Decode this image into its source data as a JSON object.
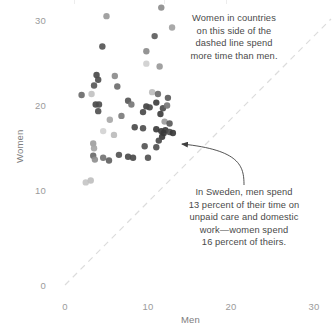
{
  "chart_data": {
    "type": "scatter",
    "title": "",
    "xlabel": "Men",
    "ylabel": "Women",
    "xlim": [
      -0.8,
      32
    ],
    "ylim": [
      -2.2,
      33
    ],
    "xticks": [
      0,
      10,
      20,
      30
    ],
    "yticks": [
      0,
      10,
      20,
      30
    ],
    "xtick_labels": [
      "0",
      "10",
      "20",
      "30"
    ],
    "ytick_labels": [
      "0",
      "10",
      "20",
      "30"
    ],
    "grid": false,
    "legend": "none",
    "reference_line": {
      "name": "parity-line",
      "type": "dashed-diagonal",
      "from": [
        0,
        0
      ],
      "to": [
        32,
        32
      ],
      "color": "#dcdcdc",
      "description": "y = x parity line"
    },
    "marker": {
      "shape": "circle",
      "radius_px": 3.2,
      "opacity": 0.92
    },
    "points": [
      {
        "x": 5.0,
        "y": 28.3,
        "c": "#9a9a9a"
      },
      {
        "x": 11.6,
        "y": 29.2,
        "c": "#8d8d8d"
      },
      {
        "x": 12.9,
        "y": 27.1,
        "c": "#a2a2a2"
      },
      {
        "x": 10.8,
        "y": 26.2,
        "c": "#5d5d5d"
      },
      {
        "x": 4.5,
        "y": 25.1,
        "c": "#555555"
      },
      {
        "x": 9.8,
        "y": 24.6,
        "c": "#8b8b8b"
      },
      {
        "x": 9.8,
        "y": 23.3,
        "c": "#cfcfcf"
      },
      {
        "x": 11.4,
        "y": 23.0,
        "c": "#999999"
      },
      {
        "x": 3.8,
        "y": 22.1,
        "c": "#4b4b4b"
      },
      {
        "x": 4.0,
        "y": 21.6,
        "c": "#4f4f4f"
      },
      {
        "x": 6.0,
        "y": 22.0,
        "c": "#8c8c8c"
      },
      {
        "x": 3.5,
        "y": 21.0,
        "c": "#5a5a5a"
      },
      {
        "x": 6.3,
        "y": 20.9,
        "c": "#6e6e6e"
      },
      {
        "x": 2.0,
        "y": 20.0,
        "c": "#6b6b6b"
      },
      {
        "x": 3.2,
        "y": 20.1,
        "c": "#c2c2c2"
      },
      {
        "x": 10.5,
        "y": 20.3,
        "c": "#bdbdbd"
      },
      {
        "x": 11.2,
        "y": 20.1,
        "c": "#6d6d6d"
      },
      {
        "x": 12.4,
        "y": 19.7,
        "c": "#5b5b5b"
      },
      {
        "x": 3.7,
        "y": 19.0,
        "c": "#4a4a4a"
      },
      {
        "x": 4.1,
        "y": 19.0,
        "c": "#4d4d4d"
      },
      {
        "x": 7.6,
        "y": 19.4,
        "c": "#575757"
      },
      {
        "x": 8.0,
        "y": 19.0,
        "c": "#777777"
      },
      {
        "x": 9.8,
        "y": 18.8,
        "c": "#434343"
      },
      {
        "x": 10.2,
        "y": 18.7,
        "c": "#4a4a4a"
      },
      {
        "x": 11.0,
        "y": 19.2,
        "c": "#3f3f3f"
      },
      {
        "x": 11.8,
        "y": 18.6,
        "c": "#4d4d4d"
      },
      {
        "x": 12.3,
        "y": 18.9,
        "c": "#777777"
      },
      {
        "x": 4.0,
        "y": 18.3,
        "c": "#515151"
      },
      {
        "x": 6.8,
        "y": 17.8,
        "c": "#7c7c7c"
      },
      {
        "x": 9.4,
        "y": 18.2,
        "c": "#4a4a4a"
      },
      {
        "x": 11.5,
        "y": 18.0,
        "c": "#3d3d3d"
      },
      {
        "x": 5.4,
        "y": 17.4,
        "c": "#a8a8a8"
      },
      {
        "x": 12.0,
        "y": 17.2,
        "c": "#9c9c9c"
      },
      {
        "x": 12.6,
        "y": 17.0,
        "c": "#5a5a5a"
      },
      {
        "x": 4.6,
        "y": 16.2,
        "c": "#d3d3d3"
      },
      {
        "x": 8.4,
        "y": 16.6,
        "c": "#4b4b4b"
      },
      {
        "x": 9.4,
        "y": 16.5,
        "c": "#4f4f4f"
      },
      {
        "x": 11.0,
        "y": 16.4,
        "c": "#3c3c3c"
      },
      {
        "x": 11.6,
        "y": 16.2,
        "c": "#3a3a3a"
      },
      {
        "x": 11.9,
        "y": 16.0,
        "c": "#3a3a3a"
      },
      {
        "x": 12.1,
        "y": 16.3,
        "c": "#3a3a3a"
      },
      {
        "x": 11.7,
        "y": 15.6,
        "c": "#3a3a3a"
      },
      {
        "x": 12.6,
        "y": 16.1,
        "c": "#4f4f4f"
      },
      {
        "x": 5.9,
        "y": 15.8,
        "c": "#bcbcbc"
      },
      {
        "x": 11.3,
        "y": 15.2,
        "c": "#4a4a4a"
      },
      {
        "x": 13.0,
        "y": 16.0,
        "c": "#3a3a3a",
        "label": "Sweden"
      },
      {
        "x": 3.4,
        "y": 14.9,
        "c": "#9e9e9e"
      },
      {
        "x": 3.5,
        "y": 14.4,
        "c": "#a6a6a6"
      },
      {
        "x": 9.6,
        "y": 14.6,
        "c": "#555555"
      },
      {
        "x": 11.0,
        "y": 14.5,
        "c": "#4f4f4f"
      },
      {
        "x": 3.4,
        "y": 13.6,
        "c": "#6a6a6a"
      },
      {
        "x": 3.6,
        "y": 13.2,
        "c": "#8f8f8f"
      },
      {
        "x": 4.6,
        "y": 13.4,
        "c": "#747474"
      },
      {
        "x": 5.3,
        "y": 13.1,
        "c": "#626262"
      },
      {
        "x": 6.5,
        "y": 13.7,
        "c": "#545454"
      },
      {
        "x": 7.6,
        "y": 13.5,
        "c": "#4c4c4c"
      },
      {
        "x": 8.2,
        "y": 13.4,
        "c": "#4a4a4a"
      },
      {
        "x": 10.0,
        "y": 13.4,
        "c": "#535353"
      },
      {
        "x": 2.5,
        "y": 10.8,
        "c": "#c6c6c6"
      },
      {
        "x": 3.1,
        "y": 11.0,
        "c": "#bfbfbf"
      }
    ],
    "annotations": [
      {
        "name": "parity-note",
        "text": "Women in countries\non this side of the\ndashed line spend\nmore time than men."
      },
      {
        "name": "sweden-note",
        "text": "In Sweden, men spend\n13 percent of their time on\nunpaid care and domestic\nwork—women spend\n16 percent of theirs.",
        "points_to": {
          "x": 13.0,
          "y": 16.0
        }
      }
    ],
    "colors": {
      "background": "#ffffff",
      "axis_text": "#9b9b9b",
      "annotation_text": "#4a4a4a",
      "reference_line": "#dcdcdc",
      "arrow": "#3f3f3f"
    }
  }
}
